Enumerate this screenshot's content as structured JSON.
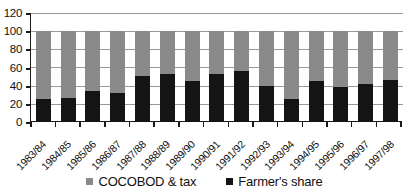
{
  "chart_data": {
    "type": "bar",
    "stacked": true,
    "title": "",
    "subtitle": "",
    "xlabel": "",
    "ylabel": "",
    "ylim": [
      0,
      120
    ],
    "yticks": [
      0,
      20,
      40,
      60,
      80,
      100,
      120
    ],
    "grid": true,
    "legend_position": "bottom",
    "categories": [
      "1983/84",
      "1984/85",
      "1985/86",
      "1986/87",
      "1987/88",
      "1988/89",
      "1989/90",
      "1990/91",
      "1991/92",
      "1992/93",
      "1993/94",
      "1994/95",
      "1995/96",
      "1996/97",
      "1997/98"
    ],
    "series": [
      {
        "name": "Farmer's share",
        "color": "#141414",
        "values": [
          25,
          26,
          34,
          32,
          51,
          53,
          45,
          53,
          56,
          40,
          25,
          45,
          39,
          42,
          46
        ]
      },
      {
        "name": "COCOBOD & tax",
        "color": "#8a8a8a",
        "values": [
          75,
          74,
          66,
          68,
          49,
          47,
          55,
          47,
          44,
          60,
          75,
          55,
          61,
          58,
          54
        ]
      }
    ]
  },
  "legend": {
    "items": [
      {
        "label": "COCOBOD & tax",
        "color": "#8a8a8a"
      },
      {
        "label": "Farmer's share",
        "color": "#141414"
      }
    ]
  },
  "axis": {
    "y_tick_labels": [
      "120",
      "100",
      "80",
      "60",
      "40",
      "20",
      "0"
    ]
  }
}
